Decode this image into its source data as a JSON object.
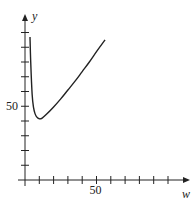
{
  "chart_data": {
    "type": "line",
    "title": "",
    "xlabel": "w",
    "ylabel": "y",
    "xlim": [
      0,
      60
    ],
    "ylim": [
      0,
      105
    ],
    "x_ticks_every": 10,
    "y_ticks_every": 10,
    "x_tick_labels": [
      {
        "value": 50,
        "label": "50"
      }
    ],
    "y_tick_labels": [
      {
        "value": 50,
        "label": "50"
      }
    ],
    "grid": false,
    "legend": null,
    "series": [
      {
        "name": "y(w)",
        "x": [
          3.5,
          4,
          5,
          6,
          7,
          8,
          10,
          12,
          15,
          20,
          25,
          30,
          35,
          40,
          45,
          50,
          56
        ],
        "values": [
          97,
          80,
          58,
          49,
          45,
          43,
          41.5,
          42,
          44.5,
          49.5,
          55,
          61,
          67,
          73.5,
          80,
          87,
          95
        ]
      }
    ]
  }
}
